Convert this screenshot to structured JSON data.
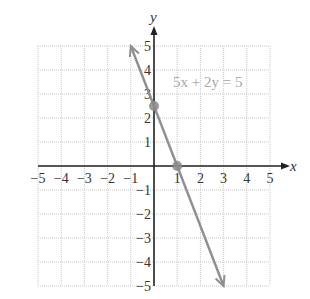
{
  "chart_data": {
    "type": "line",
    "title": "",
    "equation_label": "5x + 2y = 5",
    "xlabel": "x",
    "ylabel": "y",
    "xlim": [
      -5,
      5
    ],
    "ylim": [
      -5,
      5
    ],
    "grid": true,
    "x_ticks": [
      -5,
      -4,
      -3,
      -2,
      -1,
      1,
      2,
      3,
      4,
      5
    ],
    "y_ticks": [
      -5,
      -4,
      -3,
      -2,
      -1,
      1,
      2,
      3,
      4,
      5
    ],
    "x_tick_labels": [
      "−5",
      "−4",
      "−3",
      "−2",
      "−1",
      "1",
      "2",
      "3",
      "4",
      "5"
    ],
    "y_tick_labels": [
      "−5",
      "−4",
      "−3",
      "−2",
      "−1",
      "1",
      "2",
      "3",
      "4",
      "5"
    ],
    "series": [
      {
        "name": "5x + 2y = 5",
        "x": [
          -1,
          3
        ],
        "y": [
          5,
          -5
        ],
        "arrows": "both",
        "color": "#8f8f8f"
      }
    ],
    "points": [
      {
        "name": "y-intercept",
        "x": 0,
        "y": 2.5
      },
      {
        "name": "x-intercept",
        "x": 1,
        "y": 0
      }
    ],
    "colors": {
      "axis": "#222222",
      "grid": "#c8c8c8",
      "line": "#8f8f8f",
      "point": "#8a8a8a",
      "label": "#a8a8a8"
    }
  }
}
